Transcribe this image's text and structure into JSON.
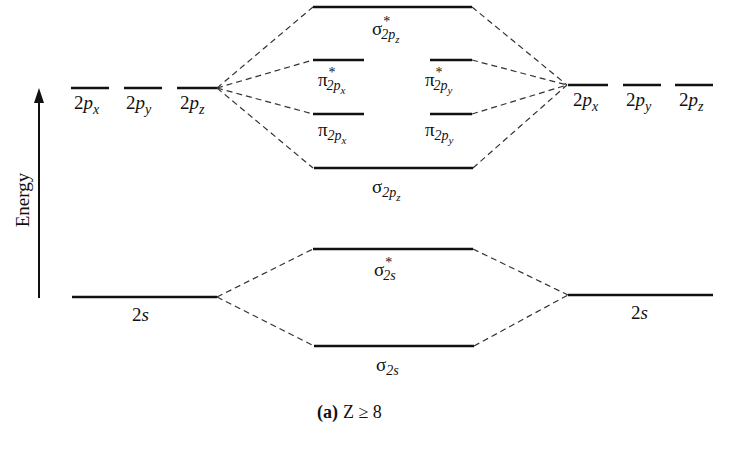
{
  "diagram": {
    "axis_label": "Energy",
    "caption": {
      "part": "(a)",
      "condition": "Z ≥ 8"
    },
    "left_atom": {
      "p_orbitals": [
        {
          "base": "2",
          "letter": "p",
          "sub": "x"
        },
        {
          "base": "2",
          "letter": "p",
          "sub": "y"
        },
        {
          "base": "2",
          "letter": "p",
          "sub": "z"
        }
      ],
      "s_orbital": {
        "base": "2",
        "letter": "s"
      }
    },
    "right_atom": {
      "p_orbitals": [
        {
          "base": "2",
          "letter": "p",
          "sub": "x"
        },
        {
          "base": "2",
          "letter": "p",
          "sub": "y"
        },
        {
          "base": "2",
          "letter": "p",
          "sub": "z"
        }
      ],
      "s_orbital": {
        "base": "2",
        "letter": "s"
      }
    },
    "molecular_orbitals": [
      {
        "id": "sigma_star_2pz",
        "greek": "σ",
        "star": "*",
        "sub": "2p",
        "subsub": "z"
      },
      {
        "id": "pi_star_2px",
        "greek": "π",
        "star": "*",
        "sub": "2p",
        "subsub": "x"
      },
      {
        "id": "pi_star_2py",
        "greek": "π",
        "star": "*",
        "sub": "2p",
        "subsub": "y"
      },
      {
        "id": "pi_2px",
        "greek": "π",
        "star": "",
        "sub": "2p",
        "subsub": "x"
      },
      {
        "id": "pi_2py",
        "greek": "π",
        "star": "",
        "sub": "2p",
        "subsub": "y"
      },
      {
        "id": "sigma_2pz",
        "greek": "σ",
        "star": "",
        "sub": "2p",
        "subsub": "z"
      },
      {
        "id": "sigma_star_2s",
        "greek": "σ",
        "star": "*",
        "sub": "2s",
        "subsub": ""
      },
      {
        "id": "sigma_2s",
        "greek": "σ",
        "star": "",
        "sub": "2s",
        "subsub": ""
      }
    ]
  }
}
